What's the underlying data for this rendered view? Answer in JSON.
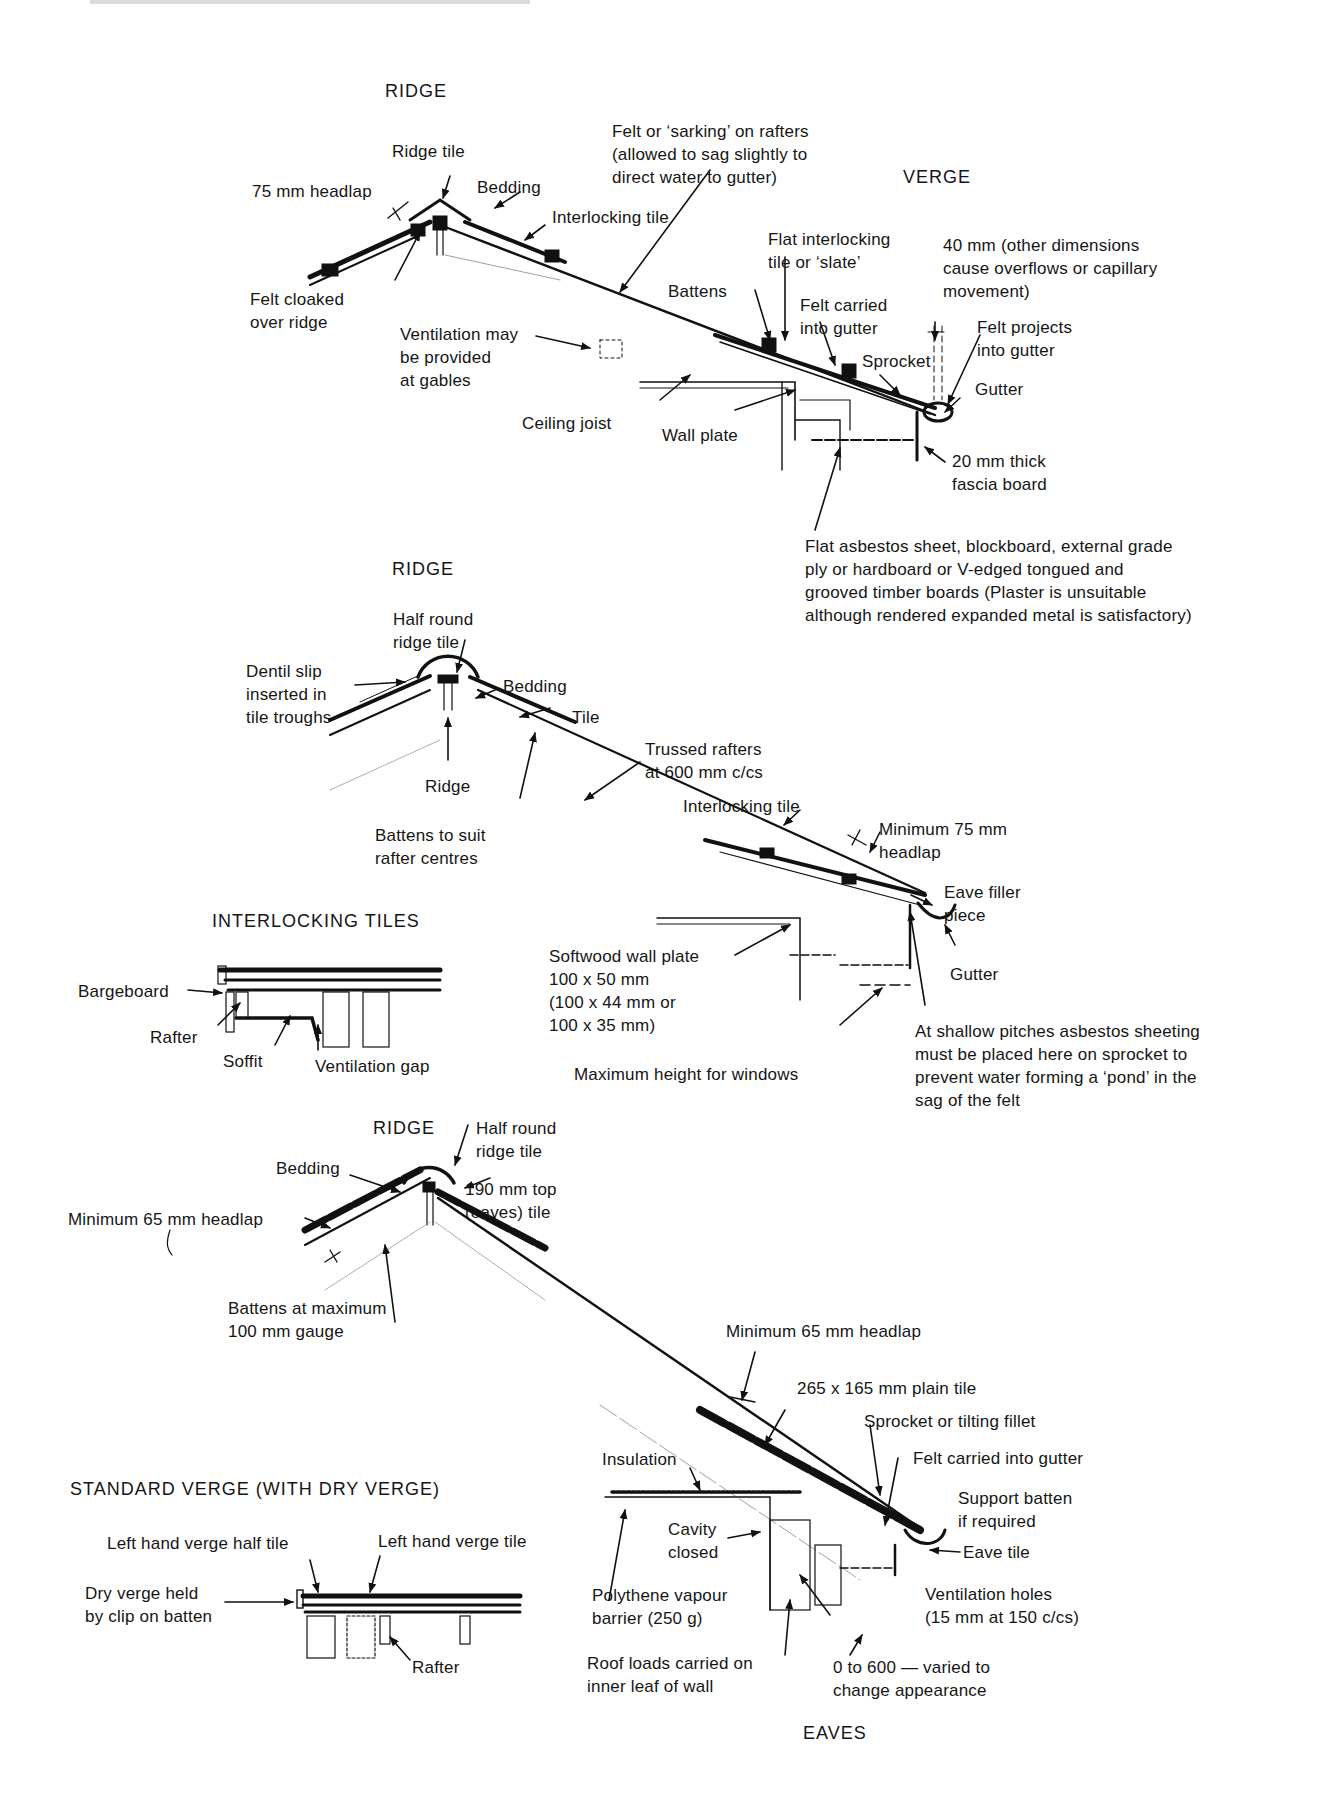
{
  "figure": {
    "cropped_header_visible": true,
    "sections": {
      "flat_interlocking": {
        "ridge_title": "RIDGE",
        "verge_title": "VERGE",
        "labels": {
          "ridge_tile": "Ridge tile",
          "headlap": "75 mm headlap",
          "bedding": "Bedding",
          "interlocking_tile": "Interlocking tile",
          "felt_cloaked": "Felt cloaked\nover ridge",
          "felt_sarking": "Felt or ‘sarking’ on rafters\n(allowed to sag slightly to\ndirect water to gutter)",
          "flat_interlocking_tile": "Flat interlocking\ntile or ‘slate’",
          "forty_mm": "40 mm (other dimensions\ncause overflows or capillary\nmovement)",
          "battens": "Battens",
          "felt_carried": "Felt carried\ninto gutter",
          "felt_projects": "Felt projects\ninto gutter",
          "ventilation": "Ventilation may\nbe provided\nat gables",
          "sprocket": "Sprocket",
          "gutter": "Gutter",
          "ceiling_joist": "Ceiling joist",
          "wall_plate": "Wall plate",
          "fascia": "20 mm thick\nfascia board",
          "soffit_note": "Flat asbestos sheet, blockboard, external grade\nply or hardboard or V-edged tongued and\ngrooved timber boards (Plaster is unsuitable\nalthough rendered expanded metal is satisfactory)"
        }
      },
      "interlocking_halfround": {
        "ridge_title": "RIDGE",
        "labels": {
          "half_round": "Half round\nridge tile",
          "dentil_slip": "Dentil slip\ninserted in\ntile troughs",
          "bedding": "Bedding",
          "tile": "Tile",
          "ridge": "Ridge",
          "battens": "Battens to suit\nrafter centres",
          "trussed_rafters": "Trussed rafters\nat 600 mm c/cs",
          "interlocking_tile": "Interlocking tile",
          "min_headlap": "Minimum 75 mm\nheadlap",
          "eave_filler": "Eave filler\npiece",
          "wall_plate": "Softwood wall plate\n100 x 50 mm\n(100 x 44 mm or\n100 x 35 mm)",
          "gutter": "Gutter",
          "shallow_pitch_note": "At shallow pitches asbestos sheeting\nmust be placed here on sprocket to\nprevent water forming a ‘pond’ in the\nsag of the felt",
          "max_height": "Maximum height for windows"
        }
      },
      "interlocking_tiles_verge": {
        "title": "INTERLOCKING TILES",
        "labels": {
          "bargeboard": "Bargeboard",
          "rafter": "Rafter",
          "soffit": "Soffit",
          "ventilation_gap": "Ventilation gap"
        }
      },
      "plain_tile": {
        "ridge_title": "RIDGE",
        "eaves_title": "EAVES",
        "labels": {
          "half_round": "Half round\nridge tile",
          "bedding": "Bedding",
          "top_tile": "190 mm top\n(eaves) tile",
          "min_headlap_left": "Minimum 65 mm headlap",
          "battens_gauge": "Battens at maximum\n100 mm gauge",
          "min_headlap": "Minimum 65 mm headlap",
          "plain_tile": "265 x 165 mm plain tile",
          "sprocket": "Sprocket or tilting fillet",
          "insulation": "Insulation",
          "felt_carried": "Felt carried into gutter",
          "support_batten": "Support batten\nif required",
          "cavity": "Cavity\nclosed",
          "eave_tile": "Eave tile",
          "vapour_barrier": "Polythene vapour\nbarrier (250 g)",
          "vent_holes": "Ventilation holes\n(15 mm at 150 c/cs)",
          "roof_loads": "Roof loads carried on\ninner leaf of wall",
          "overhang": "0 to 600 — varied to\nchange appearance"
        }
      },
      "standard_verge": {
        "title": "STANDARD VERGE (WITH DRY VERGE)",
        "labels": {
          "half_tile": "Left hand verge half tile",
          "verge_tile": "Left hand verge tile",
          "dry_verge": "Dry verge held\nby clip on batten",
          "rafter": "Rafter"
        }
      }
    }
  }
}
